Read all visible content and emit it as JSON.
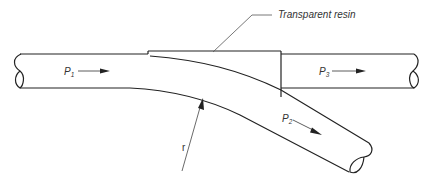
{
  "diagram": {
    "labels": {
      "resin": "Transparent resin",
      "p1": "P",
      "p1_sub": "1",
      "p2": "P",
      "p2_sub": "2",
      "p3": "P",
      "p3_sub": "3",
      "radius": "r"
    },
    "colors": {
      "stroke": "#222222",
      "leader": "#555555",
      "background": "#ffffff"
    },
    "elements": [
      "inlet pipe (P1) entering from left",
      "straight outlet pipe (P3) exiting right",
      "curved branch outlet pipe (P2) exiting lower right",
      "transparent resin block around junction",
      "radius arrow r pointing to bend"
    ]
  }
}
